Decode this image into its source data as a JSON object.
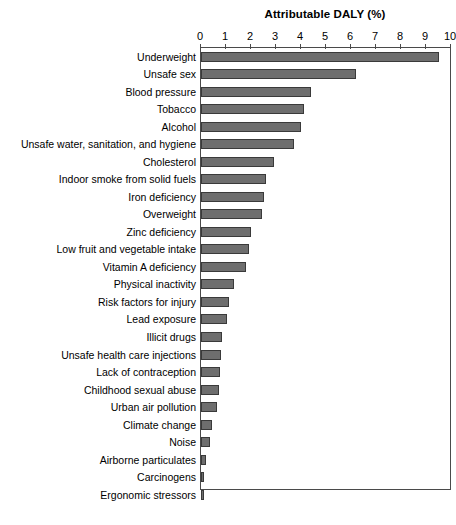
{
  "chart_data": {
    "type": "bar",
    "orientation": "horizontal",
    "title": "Attributable DALY (%)",
    "xlabel": "",
    "ylabel": "",
    "xlim": [
      0,
      10
    ],
    "xticks": [
      0,
      1,
      2,
      3,
      4,
      5,
      6,
      7,
      8,
      9,
      10
    ],
    "grid": false,
    "legend": false,
    "bar_color": "#6e6e6e",
    "bar_edge_color": "#3a3a3a",
    "axis_color": "#4a4a4a",
    "categories": [
      "Underweight",
      "Unsafe sex",
      "Blood pressure",
      "Tobacco",
      "Alcohol",
      "Unsafe water, sanitation, and hygiene",
      "Cholesterol",
      "Indoor smoke from solid fuels",
      "Iron deficiency",
      "Overweight",
      "Zinc deficiency",
      "Low fruit and vegetable intake",
      "Vitamin A deficiency",
      "Physical inactivity",
      "Risk factors for injury",
      "Lead exposure",
      "Illicit drugs",
      "Unsafe health care injections",
      "Lack of contraception",
      "Childhood sexual abuse",
      "Urban air pollution",
      "Climate change",
      "Noise",
      "Airborne particulates",
      "Carcinogens",
      "Ergonomic stressors"
    ],
    "values": [
      9.5,
      6.2,
      4.4,
      4.1,
      4.0,
      3.7,
      2.9,
      2.6,
      2.5,
      2.45,
      2.0,
      1.9,
      1.8,
      1.3,
      1.1,
      1.05,
      0.85,
      0.8,
      0.75,
      0.72,
      0.65,
      0.45,
      0.35,
      0.2,
      0.12,
      0.1
    ]
  }
}
